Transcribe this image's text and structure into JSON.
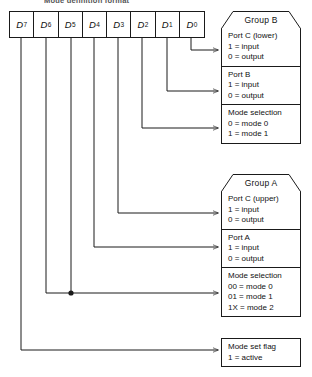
{
  "caption": "Mode definition format",
  "register": {
    "name": "control-word-register",
    "bits": [
      {
        "label": "D",
        "subscript": "7"
      },
      {
        "label": "D",
        "subscript": "6"
      },
      {
        "label": "D",
        "subscript": "5"
      },
      {
        "label": "D",
        "subscript": "4"
      },
      {
        "label": "D",
        "subscript": "3"
      },
      {
        "label": "D",
        "subscript": "2"
      },
      {
        "label": "D",
        "subscript": "1"
      },
      {
        "label": "D",
        "subscript": "0"
      }
    ]
  },
  "groups": [
    {
      "id": "group-b",
      "title": "Group B",
      "sections": [
        {
          "id": "port-c-lower",
          "lines": [
            "Port C (lower)",
            "1 = input",
            "0 = output"
          ]
        },
        {
          "id": "port-b",
          "lines": [
            "Port B",
            "1 = input",
            "0 = output"
          ]
        },
        {
          "id": "mode-selection-b",
          "lines": [
            "Mode selection",
            "0 = mode 0",
            "1 = mode 1"
          ]
        }
      ]
    },
    {
      "id": "group-a",
      "title": "Group A",
      "sections": [
        {
          "id": "port-c-upper",
          "lines": [
            "Port C (upper)",
            "1 = input",
            "0 = output"
          ]
        },
        {
          "id": "port-a",
          "lines": [
            "Port A",
            "1 = input",
            "0 = output"
          ]
        },
        {
          "id": "mode-selection-a",
          "lines": [
            "Mode selection",
            "00 = mode 0",
            "01 = mode 1",
            "1X = mode 2"
          ]
        }
      ]
    }
  ],
  "flag_box": {
    "id": "mode-set-flag",
    "lines": [
      "Mode set flag",
      "1 = active"
    ]
  },
  "colors": {
    "stroke": "#1a1a1a",
    "background": "#ffffff"
  }
}
